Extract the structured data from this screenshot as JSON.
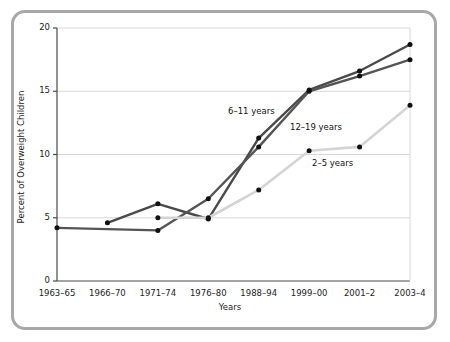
{
  "chart_data": {
    "type": "line",
    "title": "",
    "xlabel": "Years",
    "ylabel": "Percent of Overweight Children",
    "categories": [
      "1963–65",
      "1966–70",
      "1971–74",
      "1976–80",
      "1988–94",
      "1999–00",
      "2001–2",
      "2003–4"
    ],
    "ylim": [
      0,
      20
    ],
    "yticks": [
      0,
      5,
      10,
      15,
      20
    ],
    "ytick_labels": [
      "0",
      "5",
      "10",
      "15",
      "20"
    ],
    "grid": "horizontal",
    "legend_position": "inline-annotations",
    "series": [
      {
        "name": "6–11 years",
        "color": "#4a4a4a",
        "x": [
          "1963–65",
          "1966–70",
          "1971–74",
          "1976–80",
          "1988–94",
          "1999–00",
          "2001–2",
          "2003–4"
        ],
        "values": [
          null,
          4.6,
          6.1,
          4.9,
          11.3,
          15.1,
          16.6,
          18.7
        ]
      },
      {
        "name": "12–19 years",
        "color": "#555555",
        "x": [
          "1963–65",
          "1966–70",
          "1971–74",
          "1976–80",
          "1988–94",
          "1999–00",
          "2001–2",
          "2003–4"
        ],
        "values": [
          4.2,
          null,
          4.0,
          6.5,
          10.6,
          15.0,
          16.2,
          17.5
        ]
      },
      {
        "name": "2–5 years",
        "color": "#d4d4d4",
        "x": [
          "1963–65",
          "1966–70",
          "1971–74",
          "1976–80",
          "1988–94",
          "1999–00",
          "2001–2",
          "2003–4"
        ],
        "values": [
          null,
          null,
          5.0,
          5.0,
          7.2,
          10.3,
          10.6,
          13.9
        ]
      }
    ],
    "annotations": [
      {
        "text": "6–11 years",
        "x_px": 228,
        "y_px": 106
      },
      {
        "text": "12–19 years",
        "x_px": 290,
        "y_px": 122
      },
      {
        "text": "2–5 years",
        "x_px": 312,
        "y_px": 158
      }
    ]
  },
  "axes": {
    "y_title": "Percent of Overweight Children",
    "x_title": "Years",
    "y_ticks": [
      "20",
      "15",
      "10",
      "5",
      "0"
    ],
    "x_ticks": [
      "1963–65",
      "1966–70",
      "1971–74",
      "1976–80",
      "1988–94",
      "1999–00",
      "2001–2",
      "2003–4"
    ]
  },
  "colors": {
    "frame": "#a8a8a8",
    "grid": "#d8d8d8",
    "axis": "#4a4a4a",
    "series_dark": "#4a4a4a",
    "series_mid": "#555555",
    "series_light": "#d4d4d4",
    "marker": "#111111"
  }
}
